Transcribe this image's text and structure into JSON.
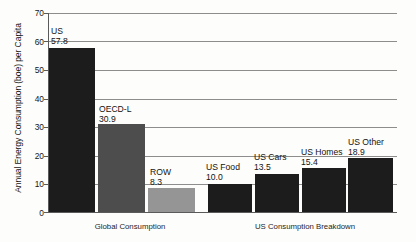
{
  "chart_data": {
    "type": "bar",
    "title": "",
    "xlabel": "",
    "ylabel": "Annual Energy Consumption (boe) per Capita",
    "ylim": [
      0,
      70
    ],
    "yticks": [
      "0",
      "10",
      "20",
      "30",
      "40",
      "50",
      "60",
      "70"
    ],
    "grid": true,
    "legend": "none",
    "categories": [
      "US",
      "OECD-L",
      "ROW",
      "US Food",
      "US Cars",
      "US Homes",
      "US Other"
    ],
    "values": [
      57.8,
      30.9,
      8.3,
      10.0,
      13.5,
      15.4,
      18.9
    ],
    "value_labels": [
      "57.8",
      "30.9",
      "8.3",
      "10.0",
      "13.5",
      "15.4",
      "18.9"
    ],
    "bars": [
      {
        "name": "US",
        "value_label": "57.8",
        "value": 57.8,
        "color": "#1c1c1c",
        "group": "Global Consumption"
      },
      {
        "name": "OECD-L",
        "value_label": "30.9",
        "value": 30.9,
        "color": "#4d4d4d",
        "group": "Global Consumption"
      },
      {
        "name": "ROW",
        "value_label": "8.3",
        "value": 8.3,
        "color": "#959595",
        "group": "Global Consumption"
      },
      {
        "name": "US Food",
        "value_label": "10.0",
        "value": 10.0,
        "color": "#1c1c1c",
        "group": "US Consumption Breakdown"
      },
      {
        "name": "US Cars",
        "value_label": "13.5",
        "value": 13.5,
        "color": "#1c1c1c",
        "group": "US Consumption Breakdown"
      },
      {
        "name": "US Homes",
        "value_label": "15.4",
        "value": 15.4,
        "color": "#1c1c1c",
        "group": "US Consumption Breakdown"
      },
      {
        "name": "US Other",
        "value_label": "18.9",
        "value": 18.9,
        "color": "#1c1c1c",
        "group": "US Consumption Breakdown"
      }
    ],
    "groups": [
      {
        "label": "Global Consumption"
      },
      {
        "label": "US Consumption Breakdown"
      }
    ]
  },
  "axis": {
    "y_title": "Annual Energy Consumption (boe) per Capita",
    "ticks": {
      "t0": "0",
      "t10": "10",
      "t20": "20",
      "t30": "30",
      "t40": "40",
      "t50": "50",
      "t60": "60",
      "t70": "70"
    }
  },
  "labels": {
    "b0_name": "US",
    "b0_value": "57.8",
    "b1_name": "OECD-L",
    "b1_value": "30.9",
    "b2_name": "ROW",
    "b2_value": "8.3",
    "b3_name": "US Food",
    "b3_value": "10.0",
    "b4_name": "US Cars",
    "b4_value": "13.5",
    "b5_name": "US Homes",
    "b5_value": "15.4",
    "b6_name": "US Other",
    "b6_value": "18.9"
  },
  "groups": {
    "g0": "Global Consumption",
    "g1": "US Consumption Breakdown"
  },
  "colors": {
    "bar_dark": "#1c1c1c",
    "bar_mid": "#4d4d4d",
    "bar_light": "#959595",
    "gridline": "#8d8d8d",
    "axis": "#5a5a5a",
    "background": "#fdfdfc",
    "text": "#131313"
  }
}
